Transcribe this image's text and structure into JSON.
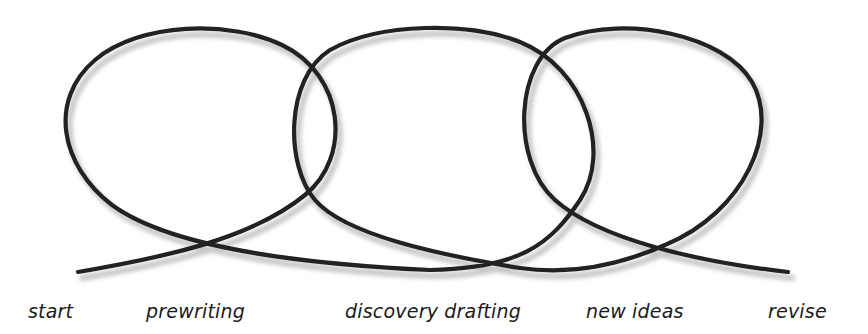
{
  "diagram": {
    "type": "looping-process",
    "line_color": "#222222",
    "shadow_color": "#9a9a9a",
    "labels": [
      {
        "id": "start",
        "text": "start",
        "x": 28
      },
      {
        "id": "prewriting",
        "text": "prewriting",
        "x": 146
      },
      {
        "id": "discovery-drafting",
        "text": "discovery drafting",
        "x": 345
      },
      {
        "id": "new-ideas",
        "text": "new ideas",
        "x": 586
      },
      {
        "id": "revise",
        "text": "revise",
        "x": 768
      }
    ],
    "loops": [
      {
        "name": "loop-1",
        "center_x": 200,
        "center_y": 140
      },
      {
        "name": "loop-2",
        "center_x": 434,
        "center_y": 140
      },
      {
        "name": "loop-3",
        "center_x": 667,
        "center_y": 140
      }
    ]
  }
}
